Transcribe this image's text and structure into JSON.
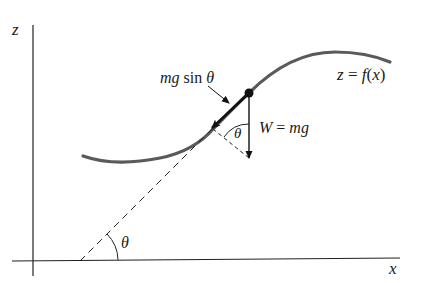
{
  "figure": {
    "axes": {
      "z_label": "z",
      "x_label": "x"
    },
    "curve": {
      "label": "z = f(x)",
      "label_parts": [
        "z",
        " = ",
        "f",
        "(",
        "x",
        ")"
      ],
      "color": "#555555"
    },
    "forces": {
      "tangential_label_parts": [
        "mg",
        " sin ",
        "θ"
      ],
      "tangential_label": "mg sin θ",
      "weight_label": "W = mg",
      "weight_label_parts": [
        "W",
        " = ",
        "mg"
      ]
    },
    "angles": {
      "incline_angle": "θ",
      "weight_angle": "θ"
    }
  }
}
